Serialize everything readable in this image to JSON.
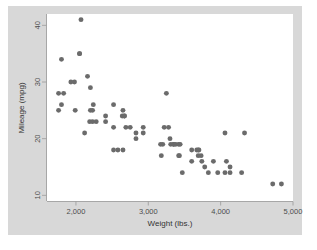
{
  "figure": {
    "background_color": "#ffffff",
    "graph_region_color": "#d8d8d8",
    "plot_region_color": "#ffffff",
    "marker_color": "#6b6b6b",
    "axis_color": "#9a9a9a"
  },
  "chart_data": {
    "type": "scatter",
    "title": "",
    "xlabel": "Weight (lbs.)",
    "ylabel": "Mileage (mpg)",
    "xlim": [
      1600,
      5000
    ],
    "ylim": [
      9,
      42
    ],
    "grid": false,
    "legend": "none",
    "xticks": [
      2000,
      3000,
      4000,
      5000
    ],
    "xtick_labels": [
      "2,000",
      "3,000",
      "4,000",
      "5,000"
    ],
    "yticks": [
      10,
      20,
      30,
      40
    ],
    "ytick_labels": [
      "10",
      "20",
      "30",
      "40"
    ],
    "marker": "circle",
    "marker_size": 3.1,
    "n_points": 74,
    "x": [
      2070,
      1800,
      2050,
      2050,
      1760,
      1980,
      2160,
      2200,
      2240,
      2200,
      1830,
      1800,
      2230,
      1760,
      2120,
      1990,
      2410,
      2280,
      2520,
      2650,
      2410,
      2670,
      2640,
      2670,
      2830,
      2690,
      2750,
      2830,
      2580,
      2930,
      3180,
      3220,
      3250,
      3280,
      3310,
      3300,
      3350,
      3350,
      3380,
      3420,
      3430,
      3440,
      3470,
      3600,
      3600,
      3670,
      3690,
      3700,
      3730,
      3740,
      3780,
      3830,
      3900,
      3960,
      4060,
      4080,
      4060,
      4130,
      4130,
      4290,
      4330,
      4720,
      4840,
      2190,
      2650,
      3170,
      2930,
      3200,
      1930,
      2230,
      2520,
      3420,
      3690,
      2520
    ],
    "y": [
      41,
      34,
      35,
      35,
      28,
      30,
      31,
      29,
      26,
      25,
      28,
      26,
      25,
      25,
      21,
      25,
      24,
      23,
      26,
      25,
      23,
      24,
      24,
      24,
      21,
      22,
      22,
      20,
      18,
      22,
      17,
      22,
      28,
      22,
      19,
      20,
      19,
      19,
      19,
      19,
      17,
      19,
      14,
      18,
      16,
      18,
      18,
      18,
      17,
      16,
      15,
      14,
      16,
      14,
      21,
      16,
      14,
      15,
      14,
      14,
      21,
      12,
      12,
      23,
      18,
      19,
      21,
      19,
      30,
      23,
      18,
      17,
      17,
      22
    ]
  }
}
